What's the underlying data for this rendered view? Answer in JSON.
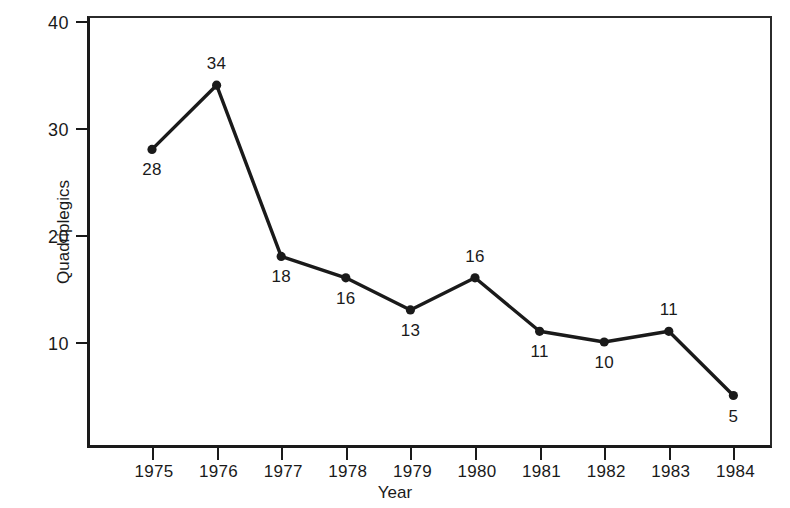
{
  "chart_data": {
    "type": "line",
    "title": "",
    "xlabel": "Year",
    "ylabel": "Quadriplegics",
    "categories": [
      "1975",
      "1976",
      "1977",
      "1978",
      "1979",
      "1980",
      "1981",
      "1982",
      "1983",
      "1984"
    ],
    "values": [
      28,
      34,
      18,
      16,
      13,
      16,
      11,
      10,
      11,
      5
    ],
    "point_labels": [
      "28",
      "34",
      "18",
      "16",
      "13",
      "16",
      "11",
      "10",
      "11",
      "5"
    ],
    "label_positions": [
      "below",
      "above",
      "below",
      "below",
      "below",
      "above",
      "below",
      "below",
      "above",
      "below"
    ],
    "ylim": [
      0,
      40
    ],
    "yticks": [
      10,
      20,
      30,
      40
    ],
    "ytick_labels": [
      "10",
      "20",
      "30",
      "40"
    ],
    "xlim": [
      "1975",
      "1984"
    ],
    "grid": false,
    "legend": false,
    "series_color": "#1a1a1a",
    "marker": "circle",
    "marker_color": "#1a1a1a",
    "background": "#ffffff",
    "axis_color": "#1a1a1a"
  }
}
